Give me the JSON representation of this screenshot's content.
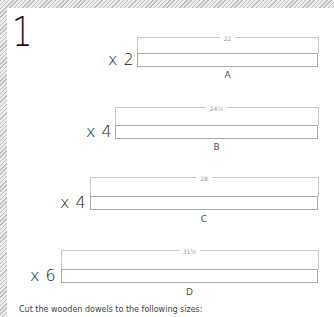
{
  "step_number": "1",
  "pieces": [
    {
      "id": "A",
      "quantity": "x 2",
      "length": "22",
      "bar_left": 137,
      "qty_left": 108,
      "dim_y": 37,
      "bar_top": 53,
      "letter_top": 70
    },
    {
      "id": "B",
      "quantity": "x 4",
      "length": "24½",
      "bar_left": 115,
      "qty_left": 86,
      "dim_y": 107,
      "bar_top": 125,
      "letter_top": 142
    },
    {
      "id": "C",
      "quantity": "x 4",
      "length": "28",
      "bar_left": 90,
      "qty_left": 60,
      "dim_y": 177,
      "bar_top": 196,
      "letter_top": 214
    },
    {
      "id": "D",
      "quantity": "x 6",
      "length": "31½",
      "bar_left": 61,
      "qty_left": 30,
      "dim_y": 250,
      "bar_top": 269,
      "letter_top": 287
    }
  ],
  "bar_right": 318,
  "footer_text": "Cut the wooden dowels to the following sizes:"
}
